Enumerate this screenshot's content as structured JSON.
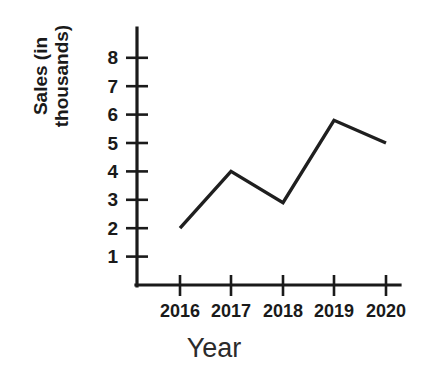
{
  "chart_data": {
    "type": "line",
    "title": "",
    "xlabel": "Year",
    "ylabel": "Sales (in thousands)",
    "ylabel_lines": [
      "Sales (in",
      "thousands)"
    ],
    "categories": [
      "2016",
      "2017",
      "2018",
      "2019",
      "2020"
    ],
    "x": [
      2016,
      2017,
      2018,
      2019,
      2020
    ],
    "values": [
      2,
      4,
      2.9,
      5.8,
      5
    ],
    "series": [
      {
        "name": "Sales",
        "values": [
          2,
          4,
          2.9,
          5.8,
          5
        ]
      }
    ],
    "ytick_labels": [
      "1",
      "2",
      "3",
      "4",
      "5",
      "6",
      "7",
      "8"
    ],
    "ytick_values": [
      1,
      2,
      3,
      4,
      5,
      6,
      7,
      8
    ],
    "xtick_labels": [
      "2016",
      "2017",
      "2018",
      "2019",
      "2020"
    ],
    "ylim": [
      0,
      9
    ],
    "xlim": [
      2015.5,
      2020.5
    ],
    "grid": false,
    "legend": false,
    "legend_position": "none",
    "line_color": "#1f1f1f",
    "axis_color": "#1a1a1a",
    "background_color": "#ffffff",
    "markers": false
  },
  "geometry": {
    "axis_x": 137,
    "axis_y": 285,
    "axis_top": 28,
    "axis_right": 400,
    "y_unit_px": 28.4,
    "x_positions": [
      180,
      231,
      283,
      334,
      386
    ],
    "y_positions_for_values": [
      228.2,
      171.4,
      202.6,
      120.3,
      143.0
    ],
    "ytick_y": [
      256.6,
      228.2,
      199.8,
      171.4,
      143.0,
      114.6,
      86.2,
      57.8
    ],
    "ytick_half_len": 11,
    "xtick_half_len": 10
  }
}
